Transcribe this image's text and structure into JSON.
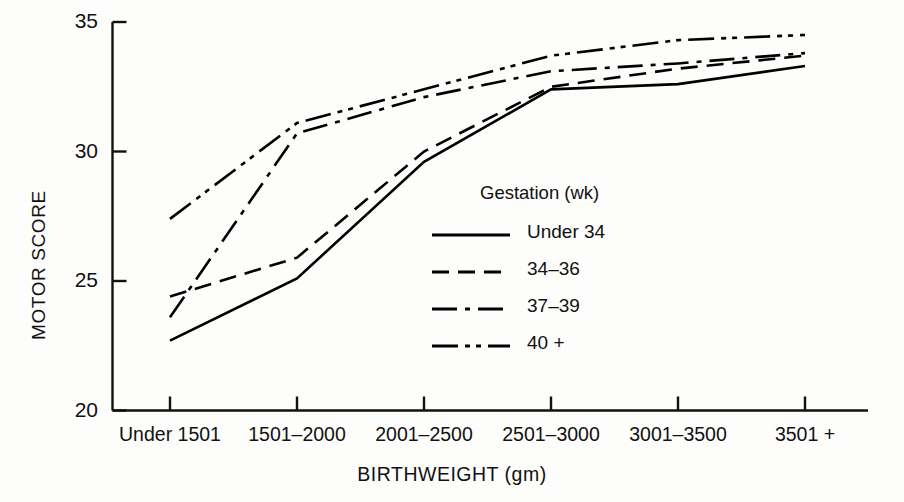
{
  "chart_data": {
    "type": "line",
    "title": "",
    "xlabel": "BIRTHWEIGHT (gm)",
    "ylabel": "MOTOR SCORE",
    "categories": [
      "Under 1501",
      "1501–2000",
      "2001–2500",
      "2501–3000",
      "3001–3500",
      "3501 +"
    ],
    "ylim": [
      20,
      35
    ],
    "yticks": [
      "20",
      "25",
      "30",
      "35"
    ],
    "ytick_values": [
      20,
      25,
      30,
      35
    ],
    "grid": false,
    "legend_position": "center-right inside axes",
    "legend_title": "Gestation (wk)",
    "series": [
      {
        "name": "Under 34",
        "linestyle": "solid",
        "color": "#000000",
        "values": [
          22.7,
          25.1,
          29.6,
          32.4,
          32.6,
          33.3
        ]
      },
      {
        "name": "34–36",
        "linestyle": "dashed",
        "color": "#000000",
        "values": [
          24.4,
          25.9,
          30.0,
          32.5,
          33.2,
          33.7
        ]
      },
      {
        "name": "37–39",
        "linestyle": "dash-dot",
        "color": "#000000",
        "values": [
          23.6,
          30.7,
          32.1,
          33.1,
          33.4,
          33.8
        ]
      },
      {
        "name": "40 +",
        "linestyle": "dash-dot-dot",
        "color": "#000000",
        "values": [
          27.4,
          31.1,
          32.4,
          33.7,
          34.3,
          34.5
        ]
      }
    ]
  },
  "axes": {
    "line_color": "#111111",
    "x_title": "BIRTHWEIGHT (gm)",
    "y_title": "MOTOR SCORE"
  },
  "legend": {
    "title": "Gestation (wk)",
    "entries": [
      {
        "label": "Under 34",
        "style": "solid"
      },
      {
        "label": "34–36",
        "style": "dashed"
      },
      {
        "label": "37–39",
        "style": "dash-dot"
      },
      {
        "label": "40 +",
        "style": "dash-dot-dot"
      }
    ]
  }
}
